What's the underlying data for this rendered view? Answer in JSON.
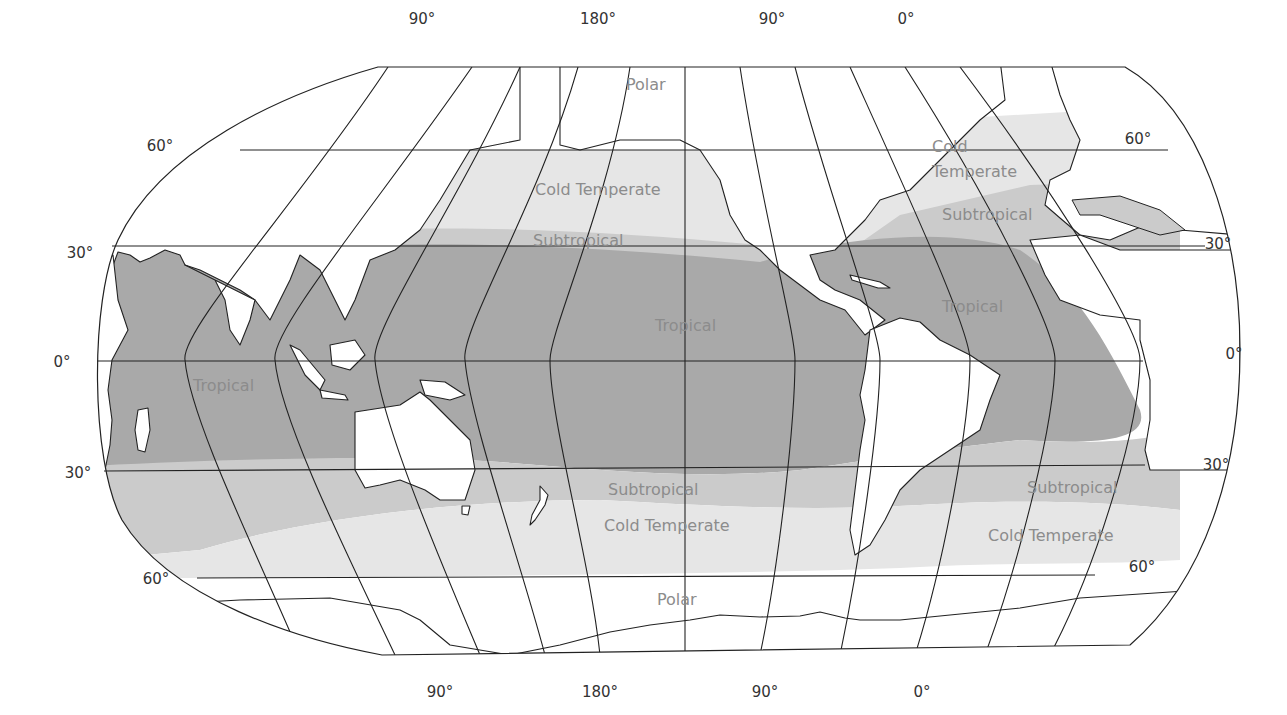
{
  "map": {
    "projection": "pseudo-cylindrical, Pacific-centered",
    "colors": {
      "polar": "#ffffff",
      "cold_temperate": "#e6e6e6",
      "subtropical": "#cbcbcb",
      "tropical": "#a9a9a9",
      "land": "#ffffff",
      "lines": "#222222",
      "zone_label": "#8c8c8c",
      "degree_label": "#333333"
    },
    "longitude_labels_top": [
      "90°",
      "180°",
      "90°",
      "0°"
    ],
    "longitude_labels_bottom": [
      "90°",
      "180°",
      "90°",
      "0°"
    ],
    "latitude_labels_left": [
      "60°",
      "30°",
      "0°",
      "30°",
      "60°"
    ],
    "latitude_labels_right": [
      "60°",
      "30°",
      "0°",
      "30°",
      "60°"
    ],
    "zone_labels": {
      "polar_north": "Polar",
      "polar_south": "Polar",
      "cold_temperate_north_pacific": "Cold Temperate",
      "subtropical_north_pacific": "Subtropical",
      "tropical_pacific": "Tropical",
      "tropical_indian": "Tropical",
      "tropical_atlantic": "Tropical",
      "cold_temperate_north_atlantic_line1": "Cold",
      "cold_temperate_north_atlantic_line2": "Temperate",
      "subtropical_north_atlantic": "Subtropical",
      "subtropical_south_pacific": "Subtropical",
      "cold_temperate_south_pacific": "Cold Temperate",
      "subtropical_south_atlantic": "Subtropical",
      "cold_temperate_south_atlantic": "Cold Temperate"
    }
  }
}
